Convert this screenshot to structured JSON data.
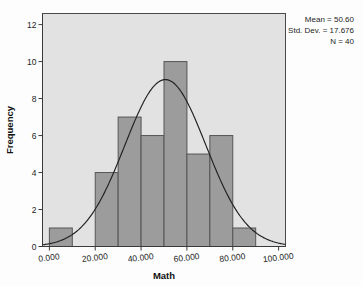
{
  "figure": {
    "type": "histogram",
    "background_color": "#fdfdfd",
    "plot_background_color": "#e2e2e2",
    "bar_fill_color": "#9c9c9c",
    "bar_border_color": "#555555",
    "curve_color": "#202020"
  },
  "annotations": {
    "mean_line": "Mean = 50.60",
    "stddev_line": "Std. Dev. = 17.676",
    "n_line": "N = 40"
  },
  "axes": {
    "x_title": "Math",
    "y_title": "Frequency",
    "x_ticks": [
      "0.000",
      "20.000",
      "40.000",
      "60.000",
      "80.000",
      "100.000"
    ],
    "y_ticks": [
      "0",
      "2",
      "4",
      "6",
      "8",
      "10",
      "12"
    ]
  },
  "chart_data": {
    "type": "bar",
    "title": "",
    "subtitle": "",
    "xlabel": "Math",
    "ylabel": "Frequency",
    "xlim": [
      -3,
      103
    ],
    "ylim": [
      0,
      12.6
    ],
    "xtick_values": [
      0,
      20,
      40,
      60,
      80,
      100
    ],
    "xtick_labels": [
      "0.000",
      "20.000",
      "40.000",
      "60.000",
      "80.000",
      "100.000"
    ],
    "ytick_values": [
      0,
      2,
      4,
      6,
      8,
      10,
      12
    ],
    "ytick_labels": [
      "0",
      "2",
      "4",
      "6",
      "8",
      "10",
      "12"
    ],
    "grid": false,
    "legend": false,
    "bin_width": 10,
    "bin_edges": [
      0,
      10,
      20,
      30,
      40,
      50,
      60,
      70,
      80,
      90
    ],
    "categories": [
      "0-10",
      "10-20",
      "20-30",
      "30-40",
      "40-50",
      "50-60",
      "60-70",
      "70-80",
      "80-90"
    ],
    "bin_centers": [
      5,
      15,
      25,
      35,
      45,
      55,
      65,
      75,
      85
    ],
    "values": [
      1,
      0,
      4,
      7,
      6,
      10,
      5,
      6,
      1
    ],
    "overlay": {
      "type": "normal-curve",
      "mean": 50.6,
      "std_dev": 17.676,
      "n": 40,
      "scale": "count * bin_width",
      "peak_value": 10.4,
      "annotation_lines": [
        "Mean = 50.60",
        "Std. Dev. = 17.676",
        "N = 40"
      ]
    },
    "statistics": {
      "mean": 50.6,
      "std_dev": 17.676,
      "n": 40
    }
  }
}
